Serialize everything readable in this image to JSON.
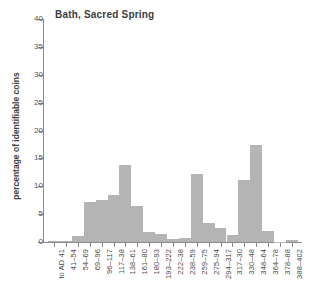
{
  "chart_data": {
    "type": "bar",
    "title": "Bath, Sacred Spring",
    "xlabel": "",
    "ylabel": "percentage of identifiable coins",
    "ylim": [
      0,
      40
    ],
    "ytick_labels": [
      "0",
      "5",
      "10",
      "15",
      "20",
      "25",
      "30",
      "35",
      "40"
    ],
    "ytick_values": [
      0,
      5,
      10,
      15,
      20,
      25,
      30,
      35,
      40
    ],
    "grid": false,
    "legend": "none",
    "bar_color": "#b4b4b4",
    "axis_color": "#8a8a8a",
    "categories": [
      "to AD 41",
      "41–54",
      "54–69",
      "69–96",
      "96–117",
      "117–38",
      "138–61",
      "161–80",
      "180–93",
      "193–222",
      "222–38",
      "238–59",
      "259–75",
      "275–94",
      "294–317",
      "317–30",
      "330–48",
      "348–64",
      "364–78",
      "378–88",
      "388–402"
    ],
    "values": [
      0.1,
      0.1,
      1.1,
      7.2,
      7.5,
      8.5,
      13.8,
      6.4,
      1.8,
      1.4,
      0.6,
      0.7,
      12.2,
      3.5,
      2.5,
      1.3,
      11.2,
      17.4,
      2.0,
      0.05,
      0.3
    ]
  }
}
